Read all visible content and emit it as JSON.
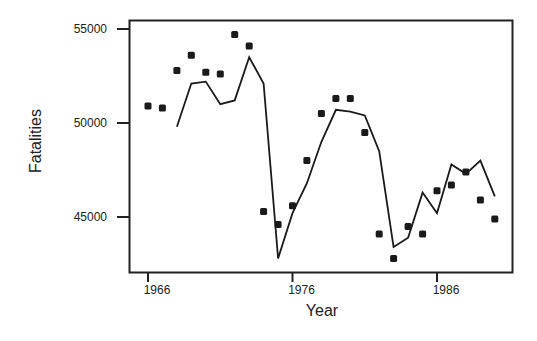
{
  "chart_data": {
    "type": "scatter",
    "title": "",
    "xlabel": "Year",
    "ylabel": "Fatalities",
    "xlim": [
      1964.8,
      1991.3
    ],
    "ylim": [
      41850,
      55250
    ],
    "x_ticks": [
      1966,
      1976,
      1986
    ],
    "x_tick_labels": [
      "1966",
      "1976",
      "1986"
    ],
    "y_ticks": [
      45000,
      50000,
      55000
    ],
    "y_tick_labels": [
      "45000",
      "50000",
      "55000"
    ],
    "grid": false,
    "legend": null,
    "series": [
      {
        "name": "Fatalities",
        "kind": "points",
        "marker": "square",
        "x": [
          1966,
          1967,
          1968,
          1969,
          1970,
          1971,
          1972,
          1973,
          1974,
          1975,
          1976,
          1977,
          1978,
          1979,
          1980,
          1981,
          1982,
          1983,
          1984,
          1985,
          1986,
          1987,
          1988,
          1989,
          1990
        ],
        "values": [
          50900,
          50800,
          52800,
          53600,
          52700,
          52600,
          54700,
          54100,
          45300,
          44600,
          45600,
          48000,
          50500,
          51300,
          51300,
          49500,
          44100,
          42800,
          44500,
          44100,
          46400,
          46700,
          47400,
          45900,
          44900
        ]
      },
      {
        "name": "Smoothed",
        "kind": "line",
        "x": [
          1968,
          1969,
          1970,
          1971,
          1972,
          1973,
          1974,
          1975,
          1976,
          1977,
          1978,
          1979,
          1980,
          1981,
          1982,
          1983,
          1984,
          1985,
          1986,
          1987,
          1988,
          1989,
          1990
        ],
        "values": [
          49800,
          52100,
          52200,
          51000,
          51200,
          53500,
          52100,
          42800,
          45200,
          46800,
          49000,
          50700,
          50600,
          50400,
          48500,
          43400,
          43900,
          46300,
          45200,
          47800,
          47300,
          48000,
          46100
        ]
      }
    ]
  }
}
